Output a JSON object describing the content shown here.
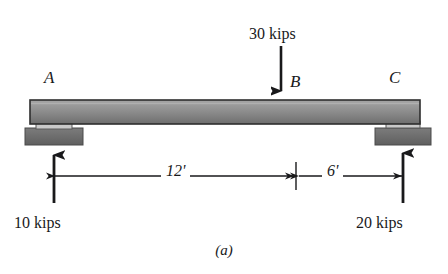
{
  "figure": {
    "caption": "(a)",
    "type": "simply-supported-beam-free-body-diagram"
  },
  "points": {
    "left_support": "A",
    "load_point": "B",
    "right_support": "C"
  },
  "loads": {
    "applied": {
      "label": "30 kips",
      "magnitude": 30,
      "unit": "kips",
      "direction": "down",
      "at": "B"
    }
  },
  "reactions": [
    {
      "label": "10 kips",
      "magnitude": 10,
      "unit": "kips",
      "direction": "up",
      "at": "A"
    },
    {
      "label": "20 kips",
      "magnitude": 20,
      "unit": "kips",
      "direction": "up",
      "at": "C"
    }
  ],
  "dimensions": [
    {
      "label": "12'",
      "value": 12,
      "unit": "ft",
      "from": "A",
      "to": "B"
    },
    {
      "label": "6'",
      "value": 6,
      "unit": "ft",
      "from": "B",
      "to": "C"
    }
  ],
  "supports": {
    "left": "pin-support",
    "right": "roller-support"
  },
  "colors": {
    "ink": "#19191b",
    "beam_light": "#9a9a9a",
    "beam_dark": "#6f6f6f",
    "support_base": "#6b6b6b",
    "bracket": "#d2d2d2"
  }
}
